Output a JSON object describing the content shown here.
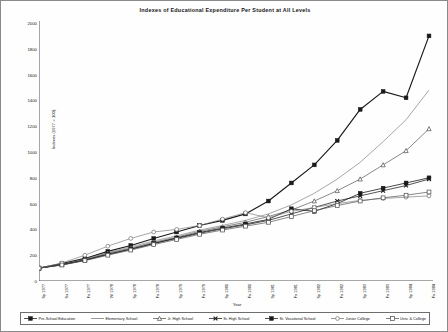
{
  "chart_data": {
    "type": "line",
    "title": "Indexes of Educational Expenditure Per Student at All Levels",
    "xlabel": "Year",
    "ylabel": "Indexes (1977 = 100)",
    "ylim": [
      0,
      2000
    ],
    "yticks": [
      0,
      200,
      400,
      600,
      800,
      1000,
      1200,
      1400,
      1600,
      1800,
      2000
    ],
    "grid": false,
    "legend_position": "bottom",
    "categories": [
      "Sp 1977",
      "Su 1977",
      "Fa 1977",
      "Wi 1978",
      "Sp 1978",
      "Fa 1978",
      "Sp 1979",
      "Fa 1979",
      "Sp 1980",
      "Fa 1980",
      "Sp 1981",
      "Fa 1981",
      "Sp 1982",
      "Fa 1982",
      "Sp 1983",
      "Fa 1983",
      "Sp 1984",
      "Fa 1984"
    ],
    "series": [
      {
        "name": "Pre-School Education",
        "marker": "filled-square",
        "values": [
          100,
          135,
          175,
          230,
          275,
          330,
          380,
          430,
          470,
          520,
          620,
          760,
          900,
          1090,
          1330,
          1470,
          1420,
          1900
        ]
      },
      {
        "name": "Elementary School",
        "marker": "plain-line",
        "values": [
          100,
          130,
          170,
          220,
          265,
          310,
          350,
          395,
          430,
          470,
          520,
          590,
          680,
          790,
          920,
          1080,
          1250,
          1480
        ]
      },
      {
        "name": "Jr. High School",
        "marker": "open-triangle",
        "values": [
          100,
          128,
          165,
          215,
          255,
          300,
          340,
          385,
          420,
          455,
          500,
          550,
          620,
          700,
          790,
          900,
          1010,
          1180
        ]
      },
      {
        "name": "Sr. High School",
        "marker": "bold-x",
        "values": [
          100,
          125,
          160,
          205,
          245,
          290,
          330,
          370,
          405,
          435,
          470,
          520,
          570,
          620,
          660,
          700,
          740,
          790
        ]
      },
      {
        "name": "Sr. Vocational School",
        "marker": "filled-square-2",
        "values": [
          100,
          126,
          162,
          208,
          248,
          292,
          334,
          376,
          410,
          442,
          478,
          560,
          540,
          600,
          680,
          720,
          760,
          800
        ]
      },
      {
        "name": "Junior College",
        "marker": "open-circle",
        "values": [
          100,
          140,
          200,
          270,
          330,
          380,
          400,
          430,
          480,
          530,
          490,
          540,
          570,
          600,
          625,
          640,
          650,
          660
        ]
      },
      {
        "name": "Univ. & College",
        "marker": "open-square",
        "values": [
          100,
          124,
          158,
          200,
          240,
          282,
          322,
          362,
          395,
          425,
          455,
          500,
          545,
          585,
          620,
          645,
          665,
          690
        ]
      }
    ]
  },
  "legend": {
    "items": [
      {
        "label": "Pre-School Education"
      },
      {
        "label": "Elementary School"
      },
      {
        "label": "Jr. High School"
      },
      {
        "label": "Sr. High School"
      },
      {
        "label": "Sr. Vocational School"
      },
      {
        "label": "Junior College"
      },
      {
        "label": "Univ. & College"
      }
    ]
  },
  "colors": {
    "axis": "#3c3c3c",
    "ink": "#141414",
    "series_dark": "#1a1a1a",
    "series_mid": "#555555",
    "series_light": "#777777",
    "frame": "#8a8a8a"
  }
}
